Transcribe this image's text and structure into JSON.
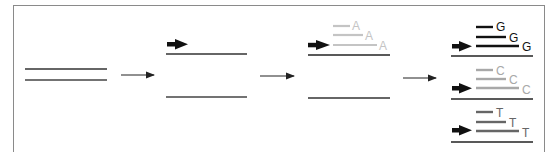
{
  "diagram": {
    "colors": {
      "frame": "#8a8a8a",
      "strand": "#333333",
      "primer": "#111111",
      "arrow": "#222222",
      "A": "#c4c4c4",
      "G": "#111111",
      "C": "#a8a8a8",
      "T": "#666666"
    },
    "steps": [
      {
        "id": "double-strand",
        "label": ""
      },
      {
        "id": "denatured-primer",
        "label": ""
      },
      {
        "id": "extension-A",
        "label": ""
      },
      {
        "id": "extension-GCT",
        "label": ""
      }
    ],
    "panel3": {
      "base": "A",
      "fragments": [
        {
          "label": "A"
        },
        {
          "label": "A"
        },
        {
          "label": "A"
        }
      ]
    },
    "panel4": {
      "groups": [
        {
          "base": "G",
          "fragments": [
            {
              "label": "G"
            },
            {
              "label": "G"
            },
            {
              "label": "G"
            }
          ]
        },
        {
          "base": "C",
          "fragments": [
            {
              "label": "C"
            },
            {
              "label": "C"
            },
            {
              "label": "C"
            }
          ]
        },
        {
          "base": "T",
          "fragments": [
            {
              "label": "T"
            },
            {
              "label": "T"
            },
            {
              "label": "T"
            }
          ]
        }
      ]
    }
  }
}
